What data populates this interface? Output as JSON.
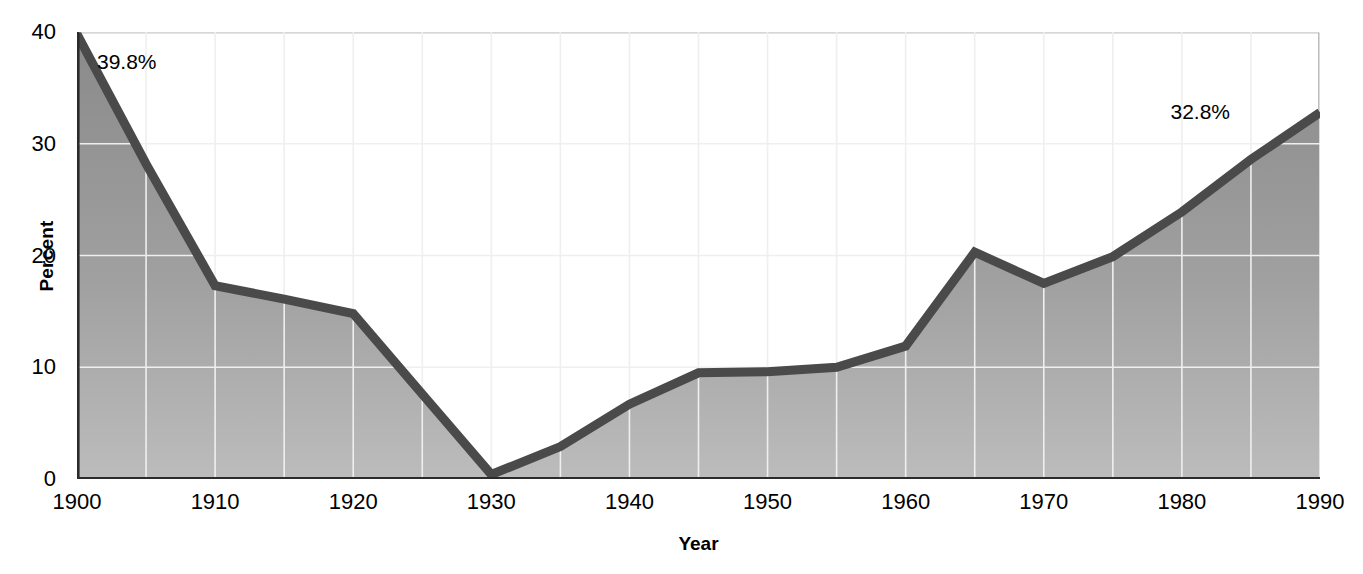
{
  "chart_data": {
    "type": "area",
    "title": "",
    "xlabel": "Year",
    "ylabel": "Percent",
    "xlim": [
      1900,
      1990
    ],
    "ylim": [
      0,
      40
    ],
    "yticks": [
      0,
      10,
      20,
      30,
      40
    ],
    "xticks": [
      1900,
      1910,
      1920,
      1930,
      1940,
      1950,
      1960,
      1970,
      1980,
      1990
    ],
    "grid": "both, minor every 5 years on x and every 10 on y",
    "legend": "none",
    "x": [
      1900,
      1905,
      1910,
      1915,
      1920,
      1925,
      1930,
      1935,
      1940,
      1945,
      1950,
      1955,
      1960,
      1965,
      1970,
      1975,
      1980,
      1985,
      1990
    ],
    "values": [
      39.8,
      28.2,
      17.3,
      16.1,
      14.8,
      7.6,
      0.4,
      2.9,
      6.7,
      9.5,
      9.6,
      10.0,
      11.9,
      20.3,
      17.5,
      19.9,
      23.9,
      28.6,
      32.8
    ],
    "annotations": [
      {
        "label": "39.8%",
        "x": 1900,
        "y": 39.8
      },
      {
        "label": "32.8%",
        "x": 1990,
        "y": 32.8
      }
    ],
    "series_name": "Percent"
  },
  "axis": {
    "ylabel": "Percent",
    "xlabel": "Year",
    "ytick_labels": [
      "0",
      "10",
      "20",
      "30",
      "40"
    ],
    "xtick_labels": [
      "1900",
      "1910",
      "1920",
      "1930",
      "1940",
      "1950",
      "1960",
      "1970",
      "1980",
      "1990"
    ]
  },
  "annotations": {
    "start": "39.8%",
    "end": "32.8%"
  },
  "colors": {
    "line": "#4a4a4a",
    "fill_top": "#8c8c8c",
    "fill_bottom": "#b6b6b6",
    "grid": "#e8e8e8",
    "axis": "#2b2b2b",
    "frame": "#8f8f8f",
    "text": "#000000"
  }
}
